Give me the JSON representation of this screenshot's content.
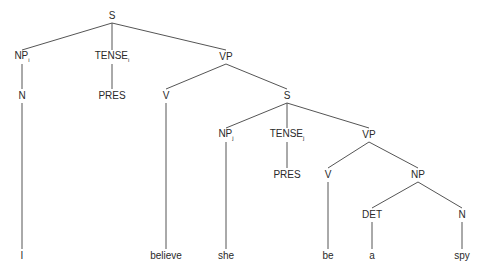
{
  "diagram": {
    "type": "syntax-tree",
    "nodes": [
      {
        "id": "S1",
        "label": "S",
        "sub": "",
        "x": 112,
        "y": 16
      },
      {
        "id": "NP1",
        "label": "NP",
        "sub": "i",
        "x": 22,
        "y": 57
      },
      {
        "id": "T1",
        "label": "TENSE",
        "sub": "i",
        "x": 112,
        "y": 57
      },
      {
        "id": "VP1",
        "label": "VP",
        "sub": "",
        "x": 226,
        "y": 57
      },
      {
        "id": "N1",
        "label": "N",
        "sub": "",
        "x": 22,
        "y": 96
      },
      {
        "id": "PRES1",
        "label": "PRES",
        "sub": "",
        "x": 112,
        "y": 96
      },
      {
        "id": "V1",
        "label": "V",
        "sub": "",
        "x": 166,
        "y": 96
      },
      {
        "id": "S2",
        "label": "S",
        "sub": "",
        "x": 287,
        "y": 96
      },
      {
        "id": "NP2",
        "label": "NP",
        "sub": "j",
        "x": 226,
        "y": 135
      },
      {
        "id": "T2",
        "label": "TENSE",
        "sub": "j",
        "x": 287,
        "y": 135
      },
      {
        "id": "VP2",
        "label": "VP",
        "sub": "",
        "x": 369,
        "y": 135
      },
      {
        "id": "PRES2",
        "label": "PRES",
        "sub": "",
        "x": 287,
        "y": 175
      },
      {
        "id": "V2",
        "label": "V",
        "sub": "",
        "x": 328,
        "y": 175
      },
      {
        "id": "NP3",
        "label": "NP",
        "sub": "",
        "x": 418,
        "y": 175
      },
      {
        "id": "DET",
        "label": "DET",
        "sub": "",
        "x": 372,
        "y": 215
      },
      {
        "id": "N2",
        "label": "N",
        "sub": "",
        "x": 462,
        "y": 215
      },
      {
        "id": "w_I",
        "label": "I",
        "sub": "",
        "x": 22,
        "y": 256
      },
      {
        "id": "w_believe",
        "label": "believe",
        "sub": "",
        "x": 166,
        "y": 256
      },
      {
        "id": "w_she",
        "label": "she",
        "sub": "",
        "x": 226,
        "y": 256
      },
      {
        "id": "w_be",
        "label": "be",
        "sub": "",
        "x": 328,
        "y": 256
      },
      {
        "id": "w_a",
        "label": "a",
        "sub": "",
        "x": 372,
        "y": 256
      },
      {
        "id": "w_spy",
        "label": "spy",
        "sub": "",
        "x": 462,
        "y": 256
      }
    ],
    "edges": [
      [
        "S1",
        "NP1"
      ],
      [
        "S1",
        "T1"
      ],
      [
        "S1",
        "VP1"
      ],
      [
        "NP1",
        "N1"
      ],
      [
        "T1",
        "PRES1"
      ],
      [
        "VP1",
        "V1"
      ],
      [
        "VP1",
        "S2"
      ],
      [
        "N1",
        "w_I"
      ],
      [
        "V1",
        "w_believe"
      ],
      [
        "S2",
        "NP2"
      ],
      [
        "S2",
        "T2"
      ],
      [
        "S2",
        "VP2"
      ],
      [
        "NP2",
        "w_she"
      ],
      [
        "T2",
        "PRES2"
      ],
      [
        "VP2",
        "V2"
      ],
      [
        "VP2",
        "NP3"
      ],
      [
        "V2",
        "w_be"
      ],
      [
        "NP3",
        "DET"
      ],
      [
        "NP3",
        "N2"
      ],
      [
        "DET",
        "w_a"
      ],
      [
        "N2",
        "w_spy"
      ]
    ]
  }
}
